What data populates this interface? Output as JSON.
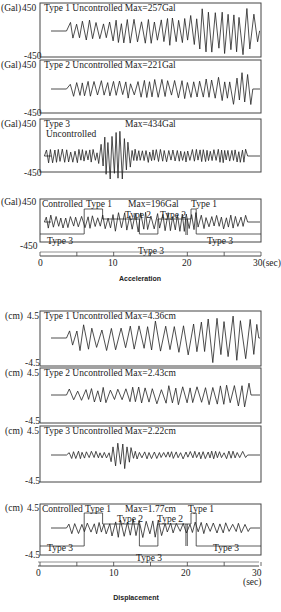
{
  "figure": {
    "sections": [
      {
        "caption": "Acceleration",
        "unit": "(Gal)",
        "ymax_label": "450",
        "ymin_label": "-450",
        "panels": [
          {
            "title": "Type 1 Uncontrolled Max=257Gal"
          },
          {
            "title": "Type 2 Uncontrolled Max=221Gal"
          },
          {
            "title": "Type 3",
            "title2": "Uncontrolled",
            "max": "Max=434Gal"
          },
          {
            "title": "Controlled",
            "max": "Max=196Gal"
          }
        ],
        "xaxis": {
          "ticks": [
            "0",
            "10",
            "20",
            "30(sec)"
          ]
        }
      },
      {
        "caption": "Displacement",
        "unit": "(cm)",
        "ymax_label": "4.5",
        "ymin_label": "-4.5",
        "panels": [
          {
            "title": "Type 1 Uncontrolled Max=4.36cm"
          },
          {
            "title": "Type 2 Uncontrolled Max=2.43cm"
          },
          {
            "title": "Type 3 Uncontrolled Max=2.22cm"
          },
          {
            "title": "Controlled",
            "max": "Max=1.77cm"
          }
        ],
        "xaxis": {
          "ticks": [
            "0",
            "10",
            "20",
            "30"
          ],
          "unit": "(sec)"
        }
      }
    ],
    "control_labels": {
      "type1": "Type 1",
      "type2": "Type 2",
      "type3": "Type 3"
    }
  },
  "chart_data": [
    {
      "type": "line",
      "title": "Acceleration",
      "xlabel": "(sec)",
      "ylabel": "(Gal)",
      "xlim": [
        0,
        30
      ],
      "ylim": [
        -450,
        450
      ],
      "x_ticks": [
        0,
        10,
        20,
        30
      ],
      "series": [
        {
          "name": "Type 1 Uncontrolled",
          "max": 257,
          "unit": "Gal"
        },
        {
          "name": "Type 2 Uncontrolled",
          "max": 221,
          "unit": "Gal"
        },
        {
          "name": "Type 3 Uncontrolled",
          "max": 434,
          "unit": "Gal"
        },
        {
          "name": "Controlled",
          "max": 196,
          "unit": "Gal"
        }
      ],
      "control_schedule": [
        {
          "from": 0,
          "to": 6,
          "type": "Type 3"
        },
        {
          "from": 6,
          "to": 8.5,
          "type": "Type 1"
        },
        {
          "from": 8.5,
          "to": 13.5,
          "type": "Type 2"
        },
        {
          "from": 13.5,
          "to": 16,
          "type": "Type 3"
        },
        {
          "from": 16,
          "to": 20.5,
          "type": "Type 2"
        },
        {
          "from": 20.5,
          "to": 21.2,
          "type": "Type 1"
        },
        {
          "from": 21.2,
          "to": 30,
          "type": "Type 3"
        }
      ]
    },
    {
      "type": "line",
      "title": "Displacement",
      "xlabel": "(sec)",
      "ylabel": "(cm)",
      "xlim": [
        0,
        30
      ],
      "ylim": [
        -4.5,
        4.5
      ],
      "x_ticks": [
        0,
        10,
        20,
        30
      ],
      "series": [
        {
          "name": "Type 1 Uncontrolled",
          "max": 4.36,
          "unit": "cm"
        },
        {
          "name": "Type 2 Uncontrolled",
          "max": 2.43,
          "unit": "cm"
        },
        {
          "name": "Type 3 Uncontrolled",
          "max": 2.22,
          "unit": "cm"
        },
        {
          "name": "Controlled",
          "max": 1.77,
          "unit": "cm"
        }
      ],
      "control_schedule": [
        {
          "from": 0,
          "to": 6,
          "type": "Type 3"
        },
        {
          "from": 6,
          "to": 8.5,
          "type": "Type 1"
        },
        {
          "from": 8.5,
          "to": 13.5,
          "type": "Type 2"
        },
        {
          "from": 13.5,
          "to": 16,
          "type": "Type 3"
        },
        {
          "from": 16,
          "to": 20.5,
          "type": "Type 2"
        },
        {
          "from": 20.5,
          "to": 21.2,
          "type": "Type 1"
        },
        {
          "from": 21.2,
          "to": 30,
          "type": "Type 3"
        }
      ]
    }
  ]
}
